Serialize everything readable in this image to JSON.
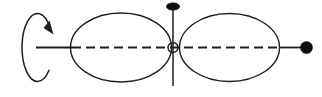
{
  "colors": {
    "ink": "#1f1f1f",
    "fill_black": "#0e0e0e",
    "background": "#ffffff"
  },
  "diagram": {
    "canvas": {
      "width": 322,
      "height": 97
    },
    "rotation_arrow": {
      "cx": 37.5,
      "cy": 47.5,
      "rx": 15.5,
      "ry": 34,
      "start_x": 49,
      "start_y": 70.2,
      "end_x": 50.2,
      "end_y": 28,
      "large_arc": 1,
      "sweep": 1,
      "head_points": "53.5,34.5 43.5,28 49.5,20.5",
      "stroke_width": 1.5
    },
    "axis": {
      "left_solid": {
        "x1": 36,
        "x2": 72,
        "y": 47.5,
        "stroke_width": 1.8
      },
      "dashed": {
        "x1": 72,
        "x2": 278,
        "y": 47.5,
        "dasharray": "9 5",
        "stroke_width": 1.8
      },
      "right_solid": {
        "x1": 280,
        "x2": 301,
        "y": 47.5,
        "stroke_width": 1.8
      }
    },
    "left_lobe": {
      "cx": 121,
      "cy": 47.5,
      "rx": 50.5,
      "ry": 34.5,
      "stroke_width": 1.4
    },
    "right_lobe": {
      "cx": 229.5,
      "cy": 47.5,
      "rx": 50,
      "ry": 34,
      "stroke_width": 1.4
    },
    "vertical_axis": {
      "x": 173,
      "y1": 9,
      "y2": 86,
      "stroke_width": 1.5
    },
    "top_pin": {
      "cx": 173,
      "cy": 6.5,
      "rx": 6.5,
      "ry": 3.5
    },
    "center_node": {
      "cx": 173,
      "cy": 47.5,
      "r": 5,
      "stroke_width": 1.4
    },
    "end_mass": {
      "cx": 306.5,
      "cy": 47.5,
      "r": 6.3
    }
  }
}
